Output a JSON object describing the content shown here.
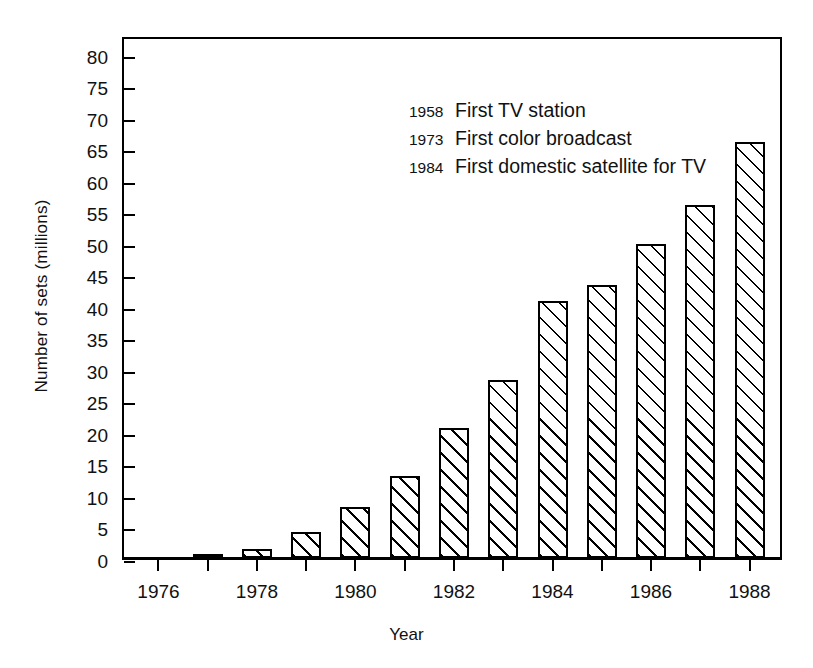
{
  "chart_data": {
    "type": "bar",
    "title": "",
    "xlabel": "Year",
    "ylabel": "Number of sets (millions)",
    "categories": [
      1976,
      1977,
      1978,
      1979,
      1980,
      1981,
      1982,
      1983,
      1984,
      1985,
      1986,
      1987,
      1988
    ],
    "values": [
      0,
      0.7,
      1.5,
      4.1,
      8.1,
      13.0,
      20.7,
      28.2,
      40.8,
      43.4,
      49.8,
      56.0,
      66.0
    ],
    "xlim": [
      1975.3,
      1988.7
    ],
    "ylim": [
      0,
      83
    ],
    "ytick_values": [
      0,
      5,
      10,
      15,
      20,
      25,
      30,
      35,
      40,
      45,
      50,
      55,
      60,
      65,
      70,
      75,
      80
    ],
    "ytick_labels": [
      "0",
      "5",
      "10",
      "15",
      "20",
      "25",
      "30",
      "35",
      "40",
      "45",
      "50",
      "55",
      "60",
      "65",
      "70",
      "75",
      "80"
    ],
    "xtick_values": [
      1976,
      1977,
      1978,
      1979,
      1980,
      1981,
      1982,
      1983,
      1984,
      1985,
      1986,
      1987,
      1988
    ],
    "xtick_labels": [
      "1976",
      "",
      "1978",
      "",
      "1980",
      "",
      "1982",
      "",
      "1984",
      "",
      "1986",
      "",
      "1988"
    ],
    "grid": false,
    "legend": null,
    "bar_fill": "diagonal-hatch",
    "bar_edge_color": "#000000",
    "annotations": [
      {
        "year": "1958",
        "text": "First TV station"
      },
      {
        "year": "1973",
        "text": "First color broadcast"
      },
      {
        "year": "1984",
        "text": "First domestic satellite for TV"
      }
    ]
  }
}
